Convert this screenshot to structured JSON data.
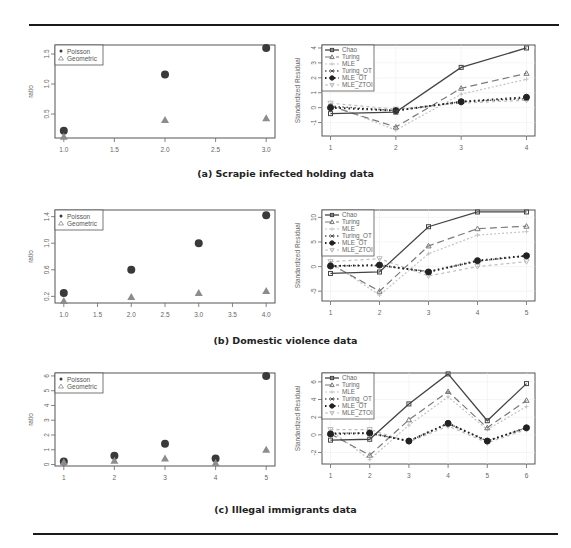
{
  "captions": {
    "a": "(a) Scrapie infected holding data",
    "b": "(b) Domestic violence data",
    "c": "(c) Illegal immigrants data"
  },
  "colors": {
    "poisson": "#3a3a3a",
    "geometric": "#8c8c8c",
    "chao": "#444444",
    "turing": "#7a7a7a",
    "mle": "#c4c4c4",
    "turing_ot": "#555555",
    "mle_ot": "#222222",
    "mle_ztoi": "#bdbdbd",
    "frame": "#555555",
    "rule": "#1a1a1a"
  },
  "chart_data": [
    {
      "id": "a-ratio",
      "type": "scatter",
      "title": "",
      "xlabel": "x",
      "ylabel": "ratio",
      "xlim": [
        1.0,
        3.0
      ],
      "ylim": [
        0.1,
        1.65
      ],
      "xticks": [
        "1.0",
        "1.5",
        "2.0",
        "2.5",
        "3.0"
      ],
      "yticks": [
        "0.5",
        "1.0",
        "1.5"
      ],
      "legend": [
        "Poisson",
        "Geometric"
      ],
      "legend_position": "top-left",
      "x": [
        1,
        2,
        3
      ],
      "series": [
        {
          "name": "Poisson",
          "values": [
            0.22,
            1.16,
            1.6
          ]
        },
        {
          "name": "Geometric",
          "values": [
            0.12,
            0.4,
            0.43
          ]
        }
      ]
    },
    {
      "id": "a-residual",
      "type": "line",
      "title": "",
      "xlabel": "x",
      "ylabel": "Standardized Residual",
      "xlim": [
        1,
        4
      ],
      "ylim": [
        -1.9,
        4.2
      ],
      "xticks": [
        "1",
        "2",
        "3",
        "4"
      ],
      "yticks": [
        "-1",
        "0",
        "1",
        "2",
        "3",
        "4"
      ],
      "legend": [
        "Chao",
        "Turing",
        "MLE",
        "Turing_OT",
        "MLE_OT",
        "MLE_ZTOI"
      ],
      "legend_position": "top-left",
      "x": [
        1,
        2,
        3,
        4
      ],
      "series": [
        {
          "name": "Chao",
          "values": [
            -0.4,
            -0.3,
            2.7,
            4.0
          ]
        },
        {
          "name": "Turing",
          "values": [
            0.1,
            -1.3,
            1.3,
            2.3
          ]
        },
        {
          "name": "MLE",
          "values": [
            0.2,
            -1.5,
            0.9,
            1.9
          ]
        },
        {
          "name": "Turing_OT",
          "values": [
            0.1,
            -0.2,
            0.4,
            0.6
          ]
        },
        {
          "name": "MLE_OT",
          "values": [
            0.0,
            -0.2,
            0.4,
            0.7
          ]
        },
        {
          "name": "MLE_ZTOI",
          "values": [
            0.3,
            -0.1,
            0.3,
            0.5
          ]
        }
      ]
    },
    {
      "id": "b-ratio",
      "type": "scatter",
      "title": "",
      "xlabel": "x",
      "ylabel": "ratio",
      "xlim": [
        1.0,
        4.0
      ],
      "ylim": [
        0.1,
        1.5
      ],
      "xticks": [
        "1.0",
        "1.5",
        "2.0",
        "2.5",
        "3.0",
        "3.5",
        "4.0"
      ],
      "yticks": [
        "0.2",
        "0.6",
        "1.0",
        "1.4"
      ],
      "legend": [
        "Poisson",
        "Geometric"
      ],
      "legend_position": "top-left",
      "x": [
        1,
        2,
        3,
        4
      ],
      "series": [
        {
          "name": "Poisson",
          "values": [
            0.25,
            0.6,
            1.0,
            1.42
          ]
        },
        {
          "name": "Geometric",
          "values": [
            0.13,
            0.19,
            0.25,
            0.28
          ]
        }
      ]
    },
    {
      "id": "b-residual",
      "type": "line",
      "title": "",
      "xlabel": "x",
      "ylabel": "Standardized Residual",
      "xlim": [
        1,
        5
      ],
      "ylim": [
        -7,
        11.5
      ],
      "xticks": [
        "1",
        "2",
        "3",
        "4",
        "5"
      ],
      "yticks": [
        "-5",
        "0",
        "5",
        "10"
      ],
      "legend": [
        "Chao",
        "Turing",
        "MLE",
        "Turing_OT",
        "MLE_OT",
        "MLE_ZTOI"
      ],
      "legend_position": "top-left",
      "x": [
        1,
        2,
        3,
        4,
        5
      ],
      "series": [
        {
          "name": "Chao",
          "values": [
            -1.4,
            -1.1,
            8.1,
            11.1,
            11.1
          ]
        },
        {
          "name": "Turing",
          "values": [
            0.5,
            -5.0,
            4.2,
            7.7,
            8.2
          ]
        },
        {
          "name": "MLE",
          "values": [
            0.8,
            -5.8,
            2.6,
            6.4,
            7.1
          ]
        },
        {
          "name": "Turing_OT",
          "values": [
            0.2,
            0.2,
            -1.0,
            1.1,
            2.2
          ]
        },
        {
          "name": "MLE_OT",
          "values": [
            0.1,
            0.3,
            -1.1,
            1.2,
            2.2
          ]
        },
        {
          "name": "MLE_ZTOI",
          "values": [
            1.0,
            1.6,
            -1.9,
            0.0,
            1.0
          ]
        }
      ]
    },
    {
      "id": "c-ratio",
      "type": "scatter",
      "title": "",
      "xlabel": "x",
      "ylabel": "ratio",
      "xlim": [
        1,
        5
      ],
      "ylim": [
        -0.1,
        6.2
      ],
      "xticks": [
        "1",
        "2",
        "3",
        "4",
        "5"
      ],
      "yticks": [
        "0",
        "1",
        "2",
        "3",
        "4",
        "5",
        "6"
      ],
      "legend": [
        "Poisson",
        "Geometric"
      ],
      "legend_position": "top-left",
      "x": [
        1,
        2,
        3,
        4,
        5
      ],
      "series": [
        {
          "name": "Poisson",
          "values": [
            0.2,
            0.6,
            1.4,
            0.4,
            6.0
          ]
        },
        {
          "name": "Geometric",
          "values": [
            0.15,
            0.25,
            0.4,
            0.1,
            1.0
          ]
        }
      ]
    },
    {
      "id": "c-residual",
      "type": "line",
      "title": "",
      "xlabel": "x",
      "ylabel": "Standardized Residual",
      "xlim": [
        1,
        6
      ],
      "ylim": [
        -3.3,
        7.0
      ],
      "xticks": [
        "1",
        "2",
        "3",
        "4",
        "5",
        "6"
      ],
      "yticks": [
        "-2",
        "0",
        "2",
        "4",
        "6"
      ],
      "legend": [
        "Chao",
        "Turing",
        "MLE",
        "Turing_OT",
        "MLE_OT",
        "MLE_ZTOI"
      ],
      "legend_position": "top-left",
      "x": [
        1,
        2,
        3,
        4,
        5,
        6
      ],
      "series": [
        {
          "name": "Chao",
          "values": [
            -0.6,
            -0.5,
            3.5,
            6.9,
            1.6,
            5.8
          ]
        },
        {
          "name": "Turing",
          "values": [
            0.1,
            -2.3,
            1.7,
            4.9,
            0.8,
            3.9
          ]
        },
        {
          "name": "MLE",
          "values": [
            0.5,
            -2.8,
            1.1,
            4.3,
            0.6,
            3.2
          ]
        },
        {
          "name": "Turing_OT",
          "values": [
            0.2,
            0.2,
            -0.7,
            1.3,
            -0.7,
            0.8
          ]
        },
        {
          "name": "MLE_OT",
          "values": [
            0.1,
            0.2,
            -0.7,
            1.3,
            -0.7,
            0.8
          ]
        },
        {
          "name": "MLE_ZTOI",
          "values": [
            0.6,
            0.6,
            -0.8,
            1.0,
            -0.9,
            0.6
          ]
        }
      ]
    }
  ]
}
